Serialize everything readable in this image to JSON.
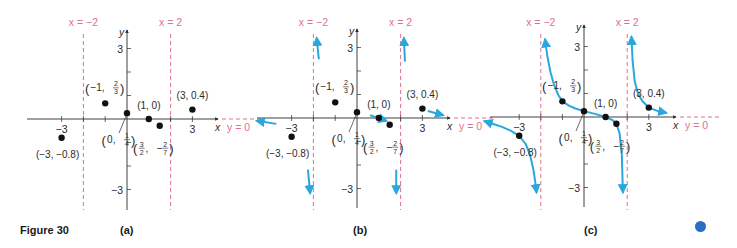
{
  "figure": {
    "title": "Figure 30",
    "marker_color": "#2a6fc4"
  },
  "colors": {
    "axis": "#2b2b2b",
    "asymptote": "#e0708f",
    "curve": "#2aa7dc",
    "point": "#111111",
    "label": "#2b2b2b"
  },
  "chart_data": [
    {
      "type": "scatter",
      "panel": "(a)",
      "title": "",
      "xlabel": "x",
      "ylabel": "y",
      "xlim": [
        -4.5,
        4.3
      ],
      "ylim": [
        -3.7,
        3.7
      ],
      "x_ticks": [
        -3,
        3
      ],
      "y_ticks": [
        3,
        -3
      ],
      "asymptotes": [
        {
          "orientation": "vertical",
          "value": -2,
          "label": "x = −2"
        },
        {
          "orientation": "vertical",
          "value": 2,
          "label": "x = 2"
        },
        {
          "orientation": "horizontal",
          "value": 0,
          "label": "y = 0"
        }
      ],
      "points": [
        {
          "x": -3,
          "y": -0.8,
          "label": "(−3, −0.8)"
        },
        {
          "x": -1,
          "y": 0.667,
          "label": "(−1, 2/3)"
        },
        {
          "x": 0,
          "y": 0.25,
          "label": "(0, 1/4)"
        },
        {
          "x": 1,
          "y": 0,
          "label": "(1, 0)"
        },
        {
          "x": 1.5,
          "y": -0.286,
          "label": "(3/2, −2/7)"
        },
        {
          "x": 3,
          "y": 0.4,
          "label": "(3, 0.4)"
        }
      ],
      "arrows": [],
      "curves": []
    },
    {
      "type": "scatter",
      "panel": "(b)",
      "title": "",
      "xlabel": "x",
      "ylabel": "y",
      "xlim": [
        -4.5,
        4.3
      ],
      "ylim": [
        -3.7,
        3.7
      ],
      "x_ticks": [
        -3,
        3
      ],
      "y_ticks": [
        3,
        -3
      ],
      "asymptotes": [
        {
          "orientation": "vertical",
          "value": -2,
          "label": "x = −2"
        },
        {
          "orientation": "vertical",
          "value": 2,
          "label": "x = 2"
        },
        {
          "orientation": "horizontal",
          "value": 0,
          "label": "y = 0"
        }
      ],
      "points": [
        {
          "x": -3,
          "y": -0.8,
          "label": "(−3, −0.8)"
        },
        {
          "x": -1,
          "y": 0.667,
          "label": "(−1, 2/3)"
        },
        {
          "x": 0,
          "y": 0.25,
          "label": "(0, 1/4)"
        },
        {
          "x": 1,
          "y": 0,
          "label": "(1, 0)"
        },
        {
          "x": 1.5,
          "y": -0.286,
          "label": "(3/2, −2/7)"
        },
        {
          "x": 3,
          "y": 0.4,
          "label": "(3, 0.4)"
        }
      ],
      "arrows": [
        {
          "desc": "left end behavior toward y=0",
          "from": [
            -3.7,
            -0.25
          ],
          "to": [
            -4.6,
            -0.12
          ]
        },
        {
          "desc": "up near x=-2 from right",
          "from": [
            -1.75,
            2.5
          ],
          "to": [
            -1.85,
            3.4
          ]
        },
        {
          "desc": "down near x=-2 from left",
          "from": [
            -2.25,
            -2.2
          ],
          "to": [
            -2.15,
            -3.2
          ]
        },
        {
          "desc": "through (1,0)",
          "from": [
            0.6,
            0.12
          ],
          "to": [
            1.35,
            -0.12
          ]
        },
        {
          "desc": "up near x=2 from right",
          "from": [
            2.2,
            2.4
          ],
          "to": [
            2.15,
            3.4
          ]
        },
        {
          "desc": "down near x=2 from left",
          "from": [
            1.8,
            -2.2
          ],
          "to": [
            1.8,
            -3.2
          ]
        },
        {
          "desc": "right end behavior toward y=0",
          "from": [
            3.25,
            0.3
          ],
          "to": [
            3.95,
            0.12
          ]
        }
      ],
      "curves": []
    },
    {
      "type": "line",
      "panel": "(c)",
      "title": "",
      "xlabel": "x",
      "ylabel": "y",
      "xlim": [
        -4.5,
        4.3
      ],
      "ylim": [
        -3.7,
        3.7
      ],
      "x_ticks": [
        -3,
        3
      ],
      "y_ticks": [
        3,
        -3
      ],
      "asymptotes": [
        {
          "orientation": "vertical",
          "value": -2,
          "label": "x = −2"
        },
        {
          "orientation": "vertical",
          "value": 2,
          "label": "x = 2"
        },
        {
          "orientation": "horizontal",
          "value": 0,
          "label": "y = 0"
        }
      ],
      "points": [
        {
          "x": -3,
          "y": -0.8,
          "label": "(−3, −0.8)"
        },
        {
          "x": -1,
          "y": 0.667,
          "label": "(−1, 2/3)"
        },
        {
          "x": 0,
          "y": 0.25,
          "label": "(0, 1/4)"
        },
        {
          "x": 1,
          "y": 0,
          "label": "(1, 0)"
        },
        {
          "x": 1.5,
          "y": -0.286,
          "label": "(3/2, −2/7)"
        },
        {
          "x": 3,
          "y": 0.4,
          "label": "(3, 0.4)"
        }
      ],
      "function": "approximately (x - 1)/((x - 2)(x + 2)) * -1 shape: R(x) = (1 - x)/(x^2 - 4)... plotted through listed points",
      "curves": [
        {
          "branch": "left",
          "x": [
            -4.6,
            -4.2,
            -3.8,
            -3.4,
            -3.0,
            -2.7,
            -2.5,
            -2.35,
            -2.25,
            -2.2
          ],
          "y": [
            -0.18,
            -0.3,
            -0.42,
            -0.58,
            -0.8,
            -1.15,
            -1.6,
            -2.2,
            -2.8,
            -3.2
          ]
        },
        {
          "branch": "middle",
          "x": [
            -1.8,
            -1.7,
            -1.55,
            -1.4,
            -1.2,
            -1.0,
            -0.7,
            -0.4,
            0.0,
            0.5,
            1.0,
            1.3,
            1.5,
            1.65,
            1.75,
            1.8
          ],
          "y": [
            3.3,
            2.6,
            1.9,
            1.4,
            0.95,
            0.667,
            0.48,
            0.36,
            0.25,
            0.13,
            0.0,
            -0.12,
            -0.286,
            -0.7,
            -1.6,
            -3.2
          ]
        },
        {
          "branch": "right",
          "x": [
            2.2,
            2.25,
            2.35,
            2.5,
            2.7,
            3.0,
            3.4,
            3.8
          ],
          "y": [
            3.4,
            2.4,
            1.5,
            1.0,
            0.68,
            0.4,
            0.26,
            0.18
          ]
        }
      ],
      "arrows": []
    }
  ],
  "panels": [
    {
      "id": "a",
      "label": "(a)",
      "origin_px": [
        127,
        119
      ],
      "unit_px": [
        21.8,
        23.5
      ],
      "x_axis_px": [
        27,
        218
      ],
      "y_axis_px": [
        30,
        210
      ]
    },
    {
      "id": "b",
      "label": "(b)",
      "origin_px": [
        357,
        118
      ],
      "unit_px": [
        21.8,
        23.5
      ],
      "x_axis_px": [
        257,
        450
      ],
      "y_axis_px": [
        29,
        208
      ]
    },
    {
      "id": "c",
      "label": "(c)",
      "origin_px": [
        584,
        117
      ],
      "unit_px": [
        21.6,
        23.5
      ],
      "x_axis_px": [
        490,
        676
      ],
      "y_axis_px": [
        25,
        207
      ]
    }
  ],
  "captions": [
    {
      "name": "figure-title",
      "text": "Figure 30",
      "x": 20,
      "y": 224
    },
    {
      "name": "panel-a-caption",
      "text": "(a)",
      "x": 120,
      "y": 224
    },
    {
      "name": "panel-b-caption",
      "text": "(b)",
      "x": 353,
      "y": 224
    },
    {
      "name": "panel-c-caption",
      "text": "(c)",
      "x": 584,
      "y": 224
    }
  ]
}
